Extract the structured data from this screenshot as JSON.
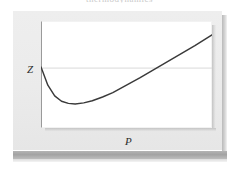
{
  "figure": {
    "caption_clipped": "thermodynamics",
    "background_color": "#ffffff",
    "panel_color": "#ebebeb",
    "plot_background": "#ffffff",
    "curve_color": "#3a3a3a",
    "reference_line_color": "#d9d9d9",
    "base_band_color": "#a3a3a3"
  },
  "axes": {
    "y_label": "Z",
    "x_label": "P"
  },
  "chart_data": {
    "type": "line",
    "title": "",
    "xlabel": "P",
    "ylabel": "Z",
    "xlim": [
      0,
      1
    ],
    "ylim": [
      0,
      1
    ],
    "grid": false,
    "legend": "none",
    "annotations": [
      {
        "name": "reference-line",
        "kind": "horizontal-line",
        "y": 0.56,
        "label": "Z"
      }
    ],
    "series": [
      {
        "name": "compressibility-factor-curve",
        "x": [
          0.0,
          0.04,
          0.08,
          0.12,
          0.16,
          0.2,
          0.25,
          0.3,
          0.36,
          0.42,
          0.5,
          0.58,
          0.66,
          0.74,
          0.82,
          0.9,
          1.0
        ],
        "y": [
          0.57,
          0.4,
          0.3,
          0.25,
          0.23,
          0.225,
          0.235,
          0.255,
          0.29,
          0.33,
          0.4,
          0.47,
          0.545,
          0.62,
          0.695,
          0.77,
          0.87
        ]
      }
    ]
  }
}
